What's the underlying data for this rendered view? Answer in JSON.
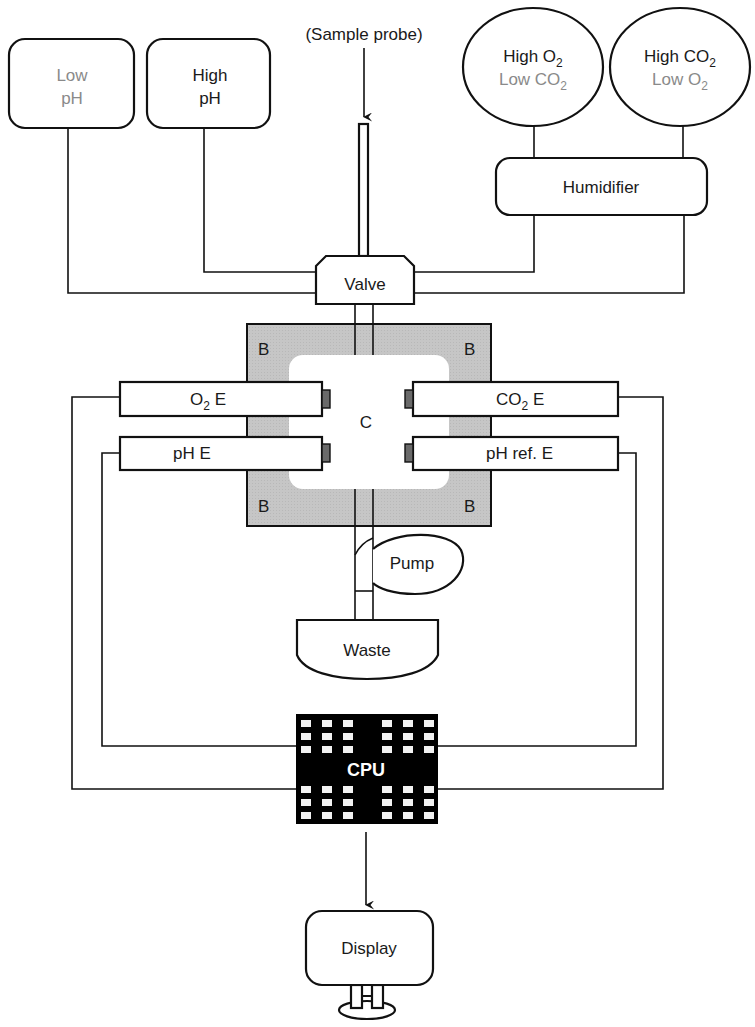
{
  "diagram": {
    "sample_probe": {
      "label": "(Sample probe)"
    },
    "reservoirs": [
      {
        "id": "low-ph",
        "line1": "Low",
        "line2": "pH",
        "text_color": "#8a8a8a"
      },
      {
        "id": "high-ph",
        "line1": "High",
        "line2": "pH",
        "text_color": "#1a1a1a"
      }
    ],
    "gases": [
      {
        "id": "gas-1",
        "line1": "High O",
        "line1_sub": "2",
        "line2": "Low CO",
        "line2_sub": "2"
      },
      {
        "id": "gas-2",
        "line1": "High CO",
        "line1_sub": "2",
        "line2": "Low O",
        "line2_sub": "2"
      }
    ],
    "humidifier": {
      "label": "Humidifier"
    },
    "valve": {
      "label": "Valve"
    },
    "bath": {
      "label": "B",
      "fill": "#c8c8c8"
    },
    "chamber": {
      "label": "C"
    },
    "electrodes": [
      {
        "id": "o2",
        "label": "O",
        "sub": "2",
        "suffix": " E",
        "side": "left"
      },
      {
        "id": "ph",
        "label": "pH E",
        "sub": "",
        "suffix": "",
        "side": "left"
      },
      {
        "id": "co2",
        "label": "CO",
        "sub": "2",
        "suffix": " E",
        "side": "right"
      },
      {
        "id": "phref",
        "label": "pH ref. E",
        "sub": "",
        "suffix": "",
        "side": "right"
      }
    ],
    "pump": {
      "label": "Pump"
    },
    "waste": {
      "label": "Waste"
    },
    "cpu": {
      "label": "CPU"
    },
    "display": {
      "label": "Display"
    }
  }
}
